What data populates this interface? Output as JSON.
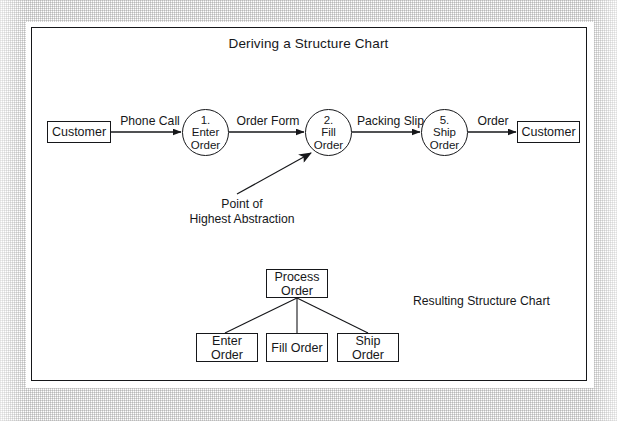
{
  "figure": {
    "title": "Deriving a Structure Chart",
    "line_color": "#16171a",
    "fill_color": "#ffffff"
  },
  "data_flow_diagram": {
    "external_entities": [
      {
        "id": "customer-source",
        "label": "Customer"
      },
      {
        "id": "customer-sink",
        "label": "Customer"
      }
    ],
    "processes": [
      {
        "id": "process-1",
        "number": "1.",
        "label": "Enter\nOrder",
        "full_text": "1.\nEnter\nOrder"
      },
      {
        "id": "process-2",
        "number": "2.",
        "label": "Fill\nOrder",
        "full_text": "2.\nFill\nOrder"
      },
      {
        "id": "process-5",
        "number": "5.",
        "label": "Ship\nOrder",
        "full_text": "5.\nShip\nOrder"
      }
    ],
    "flows": [
      {
        "id": "flow-phone-call",
        "label": "Phone Call",
        "from": "customer-source",
        "to": "process-1"
      },
      {
        "id": "flow-order-form",
        "label": "Order Form",
        "from": "process-1",
        "to": "process-2"
      },
      {
        "id": "flow-packing-slip",
        "label": "Packing Slip",
        "from": "process-2",
        "to": "process-5"
      },
      {
        "id": "flow-order",
        "label": "Order",
        "from": "process-5",
        "to": "customer-sink"
      }
    ],
    "callout": {
      "id": "point-of-highest-abstraction",
      "text": "Point of\nHighest Abstraction",
      "points_to": "process-2"
    }
  },
  "structure_chart": {
    "caption": "Resulting Structure Chart",
    "root": {
      "id": "module-process-order",
      "label": "Process\nOrder"
    },
    "children": [
      {
        "id": "module-enter-order",
        "label": "Enter\nOrder"
      },
      {
        "id": "module-fill-order",
        "label": "Fill Order"
      },
      {
        "id": "module-ship-order",
        "label": "Ship\nOrder"
      }
    ]
  }
}
